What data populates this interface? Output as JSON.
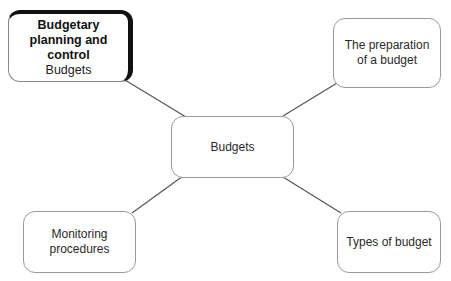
{
  "diagram": {
    "type": "mind-map",
    "center": {
      "label": "Budgets"
    },
    "main_node": {
      "title_line1": "Budgetary",
      "title_line2": "planning and control",
      "subtitle": "Budgets"
    },
    "nodes": [
      {
        "id": "preparation",
        "line1": "The preparation",
        "line2": "of a budget"
      },
      {
        "id": "monitoring",
        "line1": "Monitoring",
        "line2": "procedures"
      },
      {
        "id": "types",
        "line1": "Types of budget"
      }
    ],
    "edges": [
      {
        "from": "Budgets",
        "to": "Budgetary planning and control"
      },
      {
        "from": "Budgets",
        "to": "The preparation of a budget"
      },
      {
        "from": "Budgets",
        "to": "Monitoring procedures"
      },
      {
        "from": "Budgets",
        "to": "Types of budget"
      }
    ],
    "colors": {
      "border": "#9a9a9a",
      "line": "#555555",
      "main_shadow": "#111111"
    }
  }
}
